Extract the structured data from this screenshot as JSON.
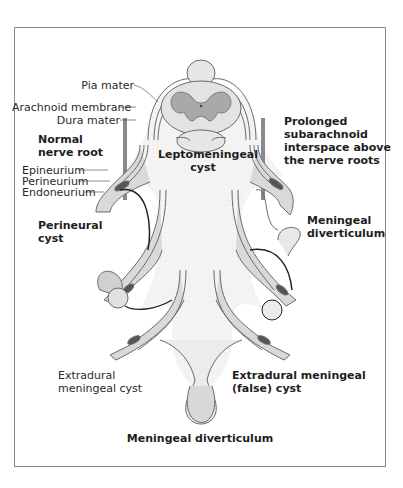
{
  "figure": {
    "type": "anatomical-diagram"
  },
  "labels": {
    "pia_mater": "Pia mater",
    "arachnoid_membrane": "Arachnoid membrane",
    "dura_mater": "Dura mater",
    "normal_nerve_root": [
      "Normal",
      "nerve root"
    ],
    "epineurium": "Epineurium",
    "perineurium": "Perineurium",
    "endoneurium": "Endoneurium",
    "leptomeningeal_cyst": [
      "Leptomeningeal",
      "cyst"
    ],
    "prolonged_subarachnoid": [
      "Prolonged",
      "subarachnoid",
      "interspace above",
      "the nerve roots"
    ],
    "perineural_cyst": [
      "Perineural",
      "cyst"
    ],
    "meningeal_diverticulum_right": [
      "Meningeal",
      "diverticulum"
    ],
    "extradural_meningeal_cyst": [
      "Extradural",
      "meningeal cyst"
    ],
    "extradural_false_cyst": [
      "Extradural meningeal",
      "(false) cyst"
    ],
    "meningeal_diverticulum_bottom": "Meningeal diverticulum"
  },
  "colors": {
    "frame": "#8a8a8a",
    "dura_fill": "#d9d9d9",
    "grey_matter": "#a9a9a9",
    "cyst_fill": "#f1f1f1",
    "outline": "#5a5a5a",
    "text": "#2a2a2a"
  }
}
